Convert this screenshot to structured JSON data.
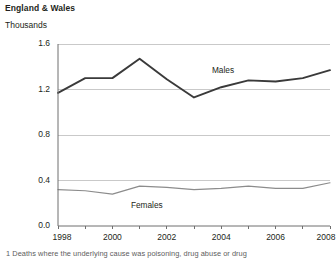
{
  "header": {
    "title": "England & Wales",
    "units": "Thousands"
  },
  "caption": "1  Deaths where the underlying cause was poisoning, drug abuse or drug",
  "labels": {
    "males": "Males",
    "females": "Females"
  },
  "colors": {
    "males_line": "#3a3a3a",
    "females_line": "#8c8c8c",
    "grid": "#c9c9c9",
    "axis": "#6f6f6f",
    "text": "#231f20"
  },
  "chart_data": {
    "type": "line",
    "title": "England & Wales",
    "subtitle": "Thousands",
    "xlabel": "",
    "ylabel": "Thousands",
    "x": [
      1998,
      1999,
      2000,
      2001,
      2002,
      2003,
      2004,
      2005,
      2006,
      2007,
      2008
    ],
    "xtick_labels": [
      "1998",
      "2000",
      "2002",
      "2004",
      "2006",
      "2008"
    ],
    "xtick_values": [
      1998,
      2000,
      2002,
      2004,
      2006,
      2008
    ],
    "ytick_labels": [
      "0.0",
      "0.4",
      "0.8",
      "1.2",
      "1.6"
    ],
    "ytick_values": [
      0.0,
      0.4,
      0.8,
      1.2,
      1.6
    ],
    "xlim": [
      1998,
      2008
    ],
    "ylim": [
      0.0,
      1.6
    ],
    "grid": true,
    "grid_axis": "y",
    "legend": "inline-labels",
    "series": [
      {
        "name": "Males",
        "values": [
          1.17,
          1.3,
          1.3,
          1.47,
          1.29,
          1.13,
          1.22,
          1.28,
          1.27,
          1.3,
          1.37
        ]
      },
      {
        "name": "Females",
        "values": [
          0.32,
          0.31,
          0.28,
          0.35,
          0.34,
          0.32,
          0.33,
          0.35,
          0.33,
          0.33,
          0.38
        ]
      }
    ]
  }
}
